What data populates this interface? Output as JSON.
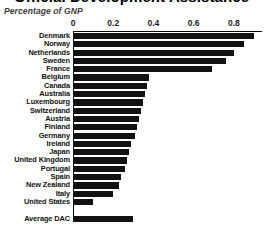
{
  "figure": {
    "title": "Official Development Assistance",
    "subtitle": "Percentage of GNP"
  },
  "chart_data": {
    "type": "bar",
    "orientation": "horizontal",
    "title": "Official Development Assistance",
    "subtitle": "Percentage of GNP",
    "xlabel": "",
    "ylabel": "",
    "xlim": [
      0,
      0.94
    ],
    "xticks": [
      "0",
      "0.2",
      "0.4",
      "0.6",
      "0.8"
    ],
    "xtick_values": [
      0,
      0.2,
      0.4,
      0.6,
      0.8
    ],
    "xtick_position": "top",
    "grid": false,
    "legend": false,
    "bar_color": "#111111",
    "categories": [
      "Denmark",
      "Norway",
      "Netherlands",
      "Sweden",
      "France",
      "Belgium",
      "Canada",
      "Australia",
      "Luxembourg",
      "Switzerland",
      "Austria",
      "Finland",
      "Germany",
      "Ireland",
      "Japan",
      "United Kingdom",
      "Portugal",
      "Spain",
      "New Zealand",
      "Italy",
      "United States",
      "Average DAC"
    ],
    "values": [
      0.9,
      0.85,
      0.8,
      0.76,
      0.69,
      0.38,
      0.37,
      0.36,
      0.35,
      0.34,
      0.33,
      0.32,
      0.31,
      0.29,
      0.28,
      0.27,
      0.26,
      0.24,
      0.23,
      0.2,
      0.1,
      0.3
    ],
    "rows": [
      {
        "label": "Denmark",
        "value": 0.9,
        "spacer_before": false
      },
      {
        "label": "Norway",
        "value": 0.85,
        "spacer_before": false
      },
      {
        "label": "Netherlands",
        "value": 0.8,
        "spacer_before": false
      },
      {
        "label": "Sweden",
        "value": 0.76,
        "spacer_before": false
      },
      {
        "label": "France",
        "value": 0.69,
        "spacer_before": false
      },
      {
        "label": "Belgium",
        "value": 0.38,
        "spacer_before": false
      },
      {
        "label": "Canada",
        "value": 0.37,
        "spacer_before": false
      },
      {
        "label": "Australia",
        "value": 0.36,
        "spacer_before": false
      },
      {
        "label": "Luxembourg",
        "value": 0.35,
        "spacer_before": false
      },
      {
        "label": "Switzerland",
        "value": 0.34,
        "spacer_before": false
      },
      {
        "label": "Austria",
        "value": 0.33,
        "spacer_before": false
      },
      {
        "label": "Finland",
        "value": 0.32,
        "spacer_before": false
      },
      {
        "label": "Germany",
        "value": 0.31,
        "spacer_before": false
      },
      {
        "label": "Ireland",
        "value": 0.29,
        "spacer_before": false
      },
      {
        "label": "Japan",
        "value": 0.28,
        "spacer_before": false
      },
      {
        "label": "United Kingdom",
        "value": 0.27,
        "spacer_before": false
      },
      {
        "label": "Portugal",
        "value": 0.26,
        "spacer_before": false
      },
      {
        "label": "Spain",
        "value": 0.24,
        "spacer_before": false
      },
      {
        "label": "New Zealand",
        "value": 0.23,
        "spacer_before": false
      },
      {
        "label": "Italy",
        "value": 0.2,
        "spacer_before": false
      },
      {
        "label": "United States",
        "value": 0.1,
        "spacer_before": false
      },
      {
        "label": "Average DAC",
        "value": 0.3,
        "spacer_before": true
      }
    ]
  }
}
